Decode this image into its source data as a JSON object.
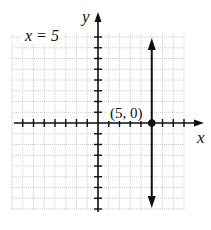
{
  "chart_data": {
    "type": "line",
    "title": "",
    "xlabel": "x",
    "ylabel": "y",
    "xlim": [
      -8,
      8
    ],
    "ylim": [
      -8,
      8
    ],
    "grid": true,
    "series": [
      {
        "name": "x = 5",
        "type": "vertical-line",
        "x": 5,
        "color": "#111111"
      }
    ],
    "points": [
      {
        "x": 5,
        "y": 0,
        "label": "(5, 0)"
      }
    ],
    "annotations": [
      {
        "text": "x = 5",
        "position": "top-left"
      }
    ]
  },
  "labels": {
    "equation": "x = 5",
    "point": "(5, 0)",
    "x_axis": "x",
    "y_axis": "y"
  }
}
